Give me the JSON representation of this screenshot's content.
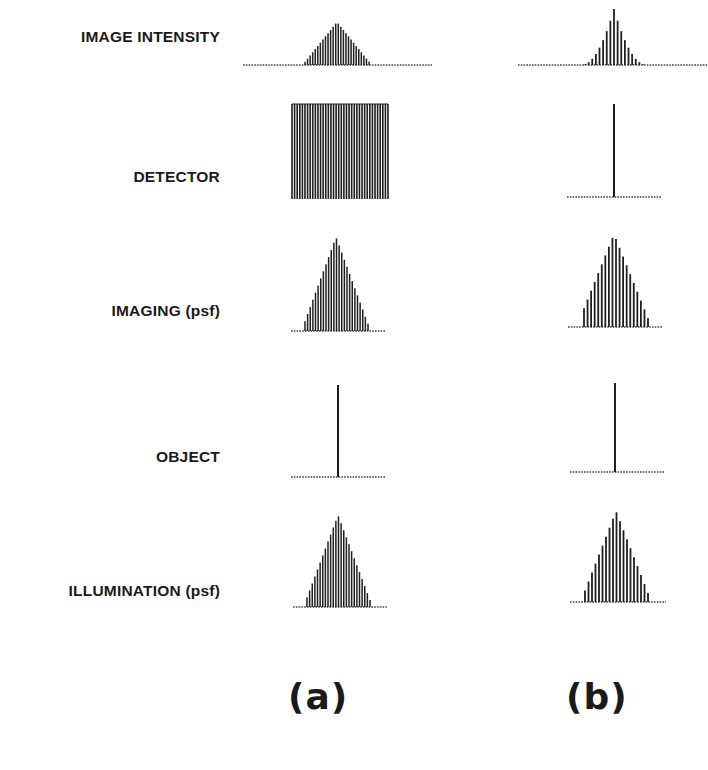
{
  "figure": {
    "rows": [
      {
        "key": "image_intensity",
        "label": "IMAGE INTENSITY",
        "label_y": 37
      },
      {
        "key": "detector",
        "label": "DETECTOR",
        "label_y": 177
      },
      {
        "key": "imaging_psf",
        "label": "IMAGING (psf)",
        "label_y": 311
      },
      {
        "key": "object",
        "label": "OBJECT",
        "label_y": 457
      },
      {
        "key": "illumination_psf",
        "label": "ILLUMINATION (psf)",
        "label_y": 591
      }
    ],
    "columns": [
      {
        "key": "a",
        "label": "(a)",
        "label_x": 288,
        "label_y": 698
      },
      {
        "key": "b",
        "label": "(b)",
        "label_x": 566,
        "label_y": 698
      }
    ],
    "colors": {
      "ink": "#1f1f1f",
      "background": "#ffffff",
      "baseline": "#444444"
    }
  },
  "chart_data": [
    {
      "type": "bar",
      "panel": "a",
      "row": "IMAGE INTENSITY",
      "shape": "triangle",
      "baseline": {
        "x0": 243,
        "x1": 432,
        "y": 65
      },
      "bars": {
        "x0": 305,
        "x1": 369,
        "count": 26,
        "peak_x": 337,
        "peak_y": 22
      }
    },
    {
      "type": "bar",
      "panel": "a",
      "row": "DETECTOR",
      "shape": "rect",
      "rect": {
        "x0": 292,
        "x1": 388,
        "y0": 104,
        "y1": 199,
        "count": 38
      }
    },
    {
      "type": "bar",
      "panel": "a",
      "row": "IMAGING (psf)",
      "shape": "triangle",
      "baseline": {
        "x0": 291,
        "x1": 385,
        "y": 331
      },
      "bars": {
        "x0": 305,
        "x1": 368,
        "count": 25,
        "peak_x": 336,
        "peak_y": 237
      }
    },
    {
      "type": "bar",
      "panel": "a",
      "row": "OBJECT",
      "shape": "delta",
      "baseline": {
        "x0": 291,
        "x1": 386,
        "y": 477
      },
      "spike": {
        "x": 338,
        "top": 385
      }
    },
    {
      "type": "bar",
      "panel": "a",
      "row": "ILLUMINATION (psf)",
      "shape": "triangle",
      "baseline": {
        "x0": 293,
        "x1": 387,
        "y": 607
      },
      "bars": {
        "x0": 307,
        "x1": 370,
        "count": 25,
        "peak_x": 338,
        "peak_y": 515
      }
    },
    {
      "type": "bar",
      "panel": "b",
      "row": "IMAGE INTENSITY",
      "shape": "peaked",
      "baseline": {
        "x0": 518,
        "x1": 708,
        "y": 65
      },
      "bars": {
        "x0": 585,
        "x1": 643,
        "count": 17,
        "peak_x": 614,
        "peak_y": 9
      }
    },
    {
      "type": "bar",
      "panel": "b",
      "row": "DETECTOR",
      "shape": "delta",
      "baseline": {
        "x0": 567,
        "x1": 662,
        "y": 197
      },
      "spike": {
        "x": 614,
        "top": 104
      }
    },
    {
      "type": "bar",
      "panel": "b",
      "row": "IMAGING (psf)",
      "shape": "triangle",
      "baseline": {
        "x0": 568,
        "x1": 663,
        "y": 327
      },
      "bars": {
        "x0": 584,
        "x1": 648,
        "count": 19,
        "peak_x": 614,
        "peak_y": 234
      }
    },
    {
      "type": "bar",
      "panel": "b",
      "row": "OBJECT",
      "shape": "delta",
      "baseline": {
        "x0": 570,
        "x1": 665,
        "y": 472
      },
      "spike": {
        "x": 615,
        "top": 383
      }
    },
    {
      "type": "bar",
      "panel": "b",
      "row": "ILLUMINATION (psf)",
      "shape": "triangle",
      "baseline": {
        "x0": 570,
        "x1": 666,
        "y": 602
      },
      "bars": {
        "x0": 585,
        "x1": 648,
        "count": 19,
        "peak_x": 616,
        "peak_y": 511
      }
    }
  ]
}
